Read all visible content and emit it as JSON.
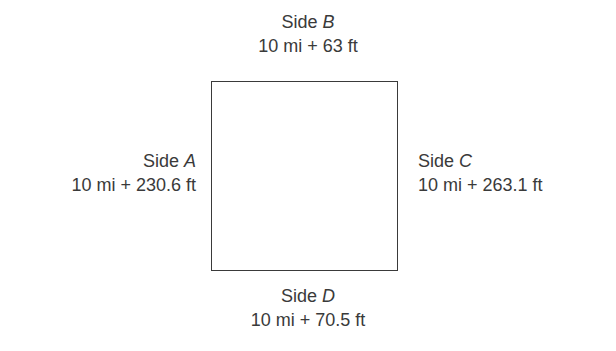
{
  "diagram": {
    "shape": "square",
    "sides": {
      "A": {
        "prefix": "Side ",
        "name": "A",
        "length": "10 mi + 230.6 ft",
        "position": "left"
      },
      "B": {
        "prefix": "Side ",
        "name": "B",
        "length": "10 mi + 63 ft",
        "position": "top"
      },
      "C": {
        "prefix": "Side ",
        "name": "C",
        "length": "10 mi + 263.1 ft",
        "position": "right"
      },
      "D": {
        "prefix": "Side ",
        "name": "D",
        "length": "10 mi + 70.5 ft",
        "position": "bottom"
      }
    },
    "colors": {
      "line": "#3a3a3a",
      "text": "#3a3a3a",
      "background": "#ffffff"
    }
  }
}
